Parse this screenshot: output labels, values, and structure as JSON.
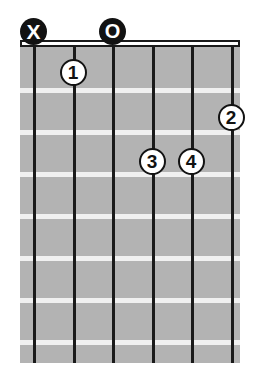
{
  "diagram": {
    "type": "guitar-chord-diagram",
    "orientation": "vertical",
    "strings_count": 6,
    "frets_count": 7,
    "colors": {
      "fretboard": "#b3b3b3",
      "string": "#1a1a1a",
      "fret": "#f0f0f0",
      "nut": "#ffffff",
      "marker_fill": "#121212",
      "dot_fill": "#ffffff"
    },
    "geometry": {
      "board_left": 20,
      "board_top": 47,
      "board_width": 220,
      "board_height": 316,
      "nut_top": 40,
      "nut_height": 7,
      "string_x": [
        33,
        73,
        112,
        152,
        191,
        231
      ],
      "fret_y": [
        88,
        130,
        172,
        214,
        256,
        298,
        340
      ],
      "string_top": 45,
      "string_height": 318
    },
    "open_markers": [
      {
        "symbol": "X",
        "string_index": 0,
        "x": 33,
        "y": 31,
        "name": "muted-string-marker",
        "kind": "muted"
      },
      {
        "symbol": "O",
        "string_index": 2,
        "x": 112,
        "y": 31,
        "name": "open-string-marker",
        "kind": "open"
      }
    ],
    "finger_dots": [
      {
        "label": "1",
        "string_index": 1,
        "fret": 1,
        "x": 73,
        "y": 72
      },
      {
        "label": "2",
        "string_index": 5,
        "fret": 2,
        "x": 231,
        "y": 117
      },
      {
        "label": "3",
        "string_index": 3,
        "fret": 3,
        "x": 152,
        "y": 161
      },
      {
        "label": "4",
        "string_index": 4,
        "fret": 3,
        "x": 191,
        "y": 161
      }
    ]
  }
}
